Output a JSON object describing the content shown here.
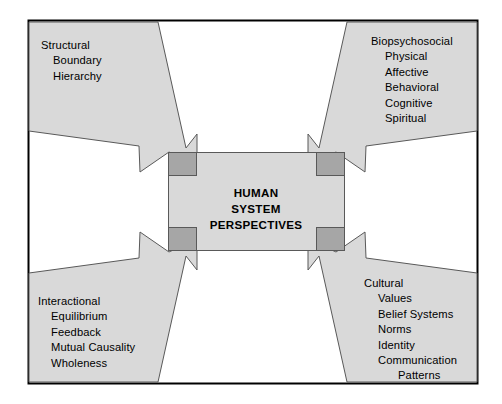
{
  "diagram": {
    "title": "HUMAN SYSTEM PERSPECTIVES",
    "center": {
      "line1": "HUMAN",
      "line2": "SYSTEM",
      "line3": "PERSPECTIVES"
    },
    "colors": {
      "shape_fill": "#d9d9d9",
      "overlap_fill": "#a6a6a6",
      "outline": "#595959",
      "frame_border": "#000000",
      "text": "#000000",
      "background": "#ffffff"
    },
    "quadrants": [
      {
        "id": "top-left",
        "heading": "Structural",
        "items": [
          "Boundary",
          "Hierarchy"
        ]
      },
      {
        "id": "top-right",
        "heading": "Biopsychosocial",
        "items": [
          "Physical",
          "Affective",
          "Behavioral",
          "Cognitive",
          "Spiritual"
        ]
      },
      {
        "id": "bottom-left",
        "heading": "Interactional",
        "items": [
          "Equilibrium",
          "Feedback",
          "Mutual Causality",
          "Wholeness"
        ]
      },
      {
        "id": "bottom-right",
        "heading": "Cultural",
        "items": [
          "Values",
          "Belief Systems",
          "Norms",
          "Identity",
          "Communication"
        ],
        "subitems": [
          "Patterns"
        ]
      }
    ]
  }
}
